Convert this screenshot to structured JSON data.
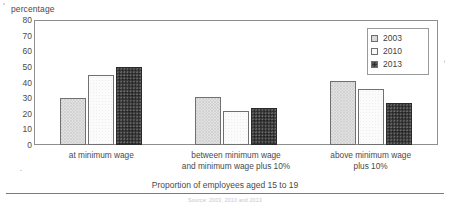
{
  "chart_data": {
    "type": "bar",
    "title": "",
    "subtitle": "",
    "categories": [
      "at minimum wage",
      "between minimum wage and minimum wage plus 10%",
      "above minimum wage plus 10%"
    ],
    "category_lines": [
      [
        "at minimum wage"
      ],
      [
        "between minimum wage",
        "and minimum wage plus 10%"
      ],
      [
        "above minimum wage",
        "plus 10%"
      ]
    ],
    "series": [
      {
        "name": "2003",
        "values": [
          30,
          31,
          41
        ],
        "swatch": "light-dotted",
        "color": "#e2e2e2"
      },
      {
        "name": "2010",
        "values": [
          45,
          22,
          36
        ],
        "swatch": "white",
        "color": "#fbfbfb"
      },
      {
        "name": "2013",
        "values": [
          50,
          24,
          27
        ],
        "swatch": "dark-dotted",
        "color": "#3a3a3a"
      }
    ],
    "ylabel": "percentage",
    "xlabel": "Proportion of employees aged 15 to 19",
    "ylim": [
      0,
      80
    ],
    "ytick_step": 10,
    "yticks": [
      0,
      10,
      20,
      30,
      40,
      50,
      60,
      70,
      80
    ],
    "grid": false,
    "legend_position": "top-right",
    "legend_entries": [
      "2003",
      "2010",
      "2013"
    ]
  },
  "axes": {
    "y_title": "percentage",
    "x_title": "Proportion of employees aged 15 to 19"
  },
  "legend": {
    "items": [
      {
        "label": "2003"
      },
      {
        "label": "2010"
      },
      {
        "label": "2013"
      }
    ]
  },
  "footer": {
    "source_note": "Source:  2003, 2010 and 2013"
  }
}
